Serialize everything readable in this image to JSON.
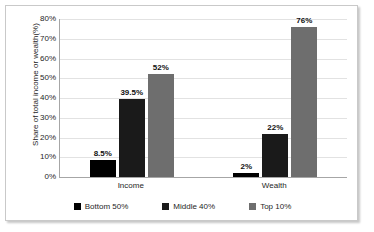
{
  "chart_data": {
    "type": "bar",
    "title": "",
    "xlabel": "",
    "ylabel": "Share of total income or wealth(%)",
    "categories": [
      "Income",
      "Wealth"
    ],
    "series": [
      {
        "name": "Bottom 50%",
        "color": "#000000",
        "values": [
          8.5,
          2
        ],
        "labels": [
          "8.5%",
          "2%"
        ]
      },
      {
        "name": "Middle 40%",
        "color": "#1a1a1a",
        "values": [
          39.5,
          22
        ],
        "labels": [
          "39.5%",
          "22%"
        ]
      },
      {
        "name": "Top 10%",
        "color": "#6e6e6e",
        "values": [
          52,
          76
        ],
        "labels": [
          "52%",
          "76%"
        ]
      }
    ],
    "ylim": [
      0,
      80
    ],
    "ytick_labels": [
      "0%",
      "10%",
      "20%",
      "30%",
      "40%",
      "50%",
      "60%",
      "70%",
      "80%"
    ],
    "ytick_values": [
      0,
      10,
      20,
      30,
      40,
      50,
      60,
      70,
      80
    ],
    "grid": true,
    "legend_position": "bottom"
  },
  "colors": {
    "frame_border": "#c9c9c9",
    "axis_line": "#a6a6a6",
    "gridline": "#e2e2e2",
    "text": "#262626",
    "plot_background": "#ffffff"
  }
}
